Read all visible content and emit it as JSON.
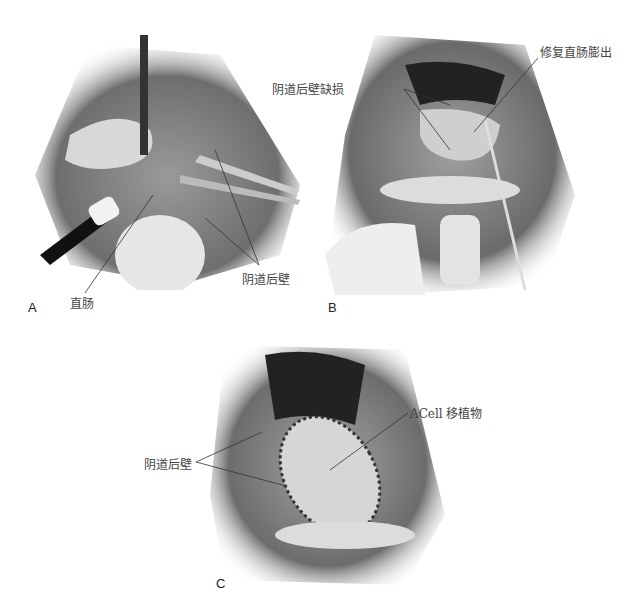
{
  "figure": {
    "panels": [
      {
        "id": "A",
        "letter": "A",
        "labels": {
          "rectum": "直肠",
          "posterior_vaginal_wall": "阴道后壁"
        }
      },
      {
        "id": "B",
        "letter": "B",
        "labels": {
          "posterior_wall_defect": "阴道后壁缺损",
          "repaired_rectocele": "修复直肠膨出"
        }
      },
      {
        "id": "C",
        "letter": "C",
        "labels": {
          "posterior_vaginal_wall": "阴道后壁",
          "acell_graft": "ACell 移植物"
        }
      }
    ]
  }
}
